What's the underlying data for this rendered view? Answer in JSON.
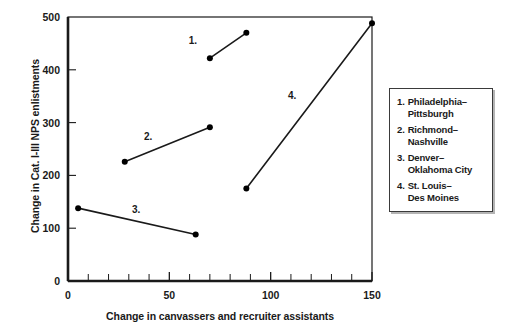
{
  "chart_data": {
    "type": "line",
    "title": "",
    "xlabel": "Change in canvassers and recruiter assistants",
    "ylabel": "Change in Cat. I-III NPS enlistments",
    "xlim": [
      0,
      150
    ],
    "ylim": [
      0,
      500
    ],
    "grid": false,
    "legend_position": "right",
    "xticks": [
      0,
      50,
      100,
      150
    ],
    "xtick_labels": [
      "0",
      "50",
      "100",
      "150"
    ],
    "x_minor_tick_step": 10,
    "yticks": [
      0,
      100,
      200,
      300,
      400,
      500
    ],
    "ytick_labels": [
      "0",
      "100",
      "200",
      "300",
      "400",
      "500"
    ],
    "marker": "filled-circle",
    "series": [
      {
        "name": "Philadelphia-Pittsburgh",
        "tag": "1.",
        "tag_x": 62,
        "tag_y": 455,
        "points": [
          {
            "x": 70,
            "y": 422
          },
          {
            "x": 88,
            "y": 470
          }
        ]
      },
      {
        "name": "Richmond-Nashville",
        "tag": "2.",
        "tag_x": 40,
        "tag_y": 272,
        "points": [
          {
            "x": 28,
            "y": 226
          },
          {
            "x": 70,
            "y": 291
          }
        ]
      },
      {
        "name": "Denver-Oklahoma City",
        "tag": "3.",
        "tag_x": 34,
        "tag_y": 134,
        "points": [
          {
            "x": 5,
            "y": 138
          },
          {
            "x": 63,
            "y": 88
          }
        ]
      },
      {
        "name": "St. Louis-Des Moines",
        "tag": "4.",
        "tag_x": 111,
        "tag_y": 350,
        "points": [
          {
            "x": 88,
            "y": 175
          },
          {
            "x": 150,
            "y": 488
          }
        ]
      }
    ],
    "colors": {
      "line": "#1a1a1a",
      "marker": "#000000",
      "axis": "#1a1a1a",
      "background": "#ffffff",
      "legend_border": "#3a3a3a",
      "legend_shadow": "#b4b4b4"
    }
  },
  "legend": {
    "items": [
      {
        "number": "1.",
        "label": "Philadelphia–\nPittsburgh"
      },
      {
        "number": "2.",
        "label": "Richmond–\nNashville"
      },
      {
        "number": "3.",
        "label": "Denver–\nOklahoma City"
      },
      {
        "number": "4.",
        "label": "St. Louis–\nDes Moines"
      }
    ]
  }
}
